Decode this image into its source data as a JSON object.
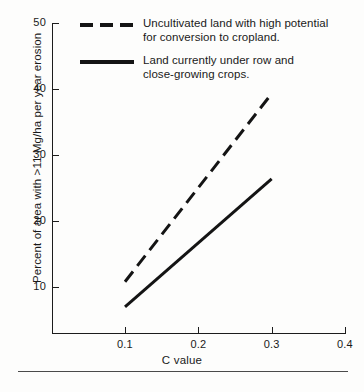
{
  "chart_data": {
    "type": "line",
    "title": "",
    "xlabel": "C value",
    "ylabel": "Percent of area with >11 Mg/ha per year erosion",
    "xlim": [
      0.065,
      0.4
    ],
    "ylim": [
      6.5,
      50
    ],
    "xticks": [
      "0.1",
      "0.2",
      "0.3",
      "0.4"
    ],
    "xtick_values": [
      0.1,
      0.2,
      0.3,
      0.4
    ],
    "yticks": [
      "10",
      "20",
      "30",
      "40",
      "50"
    ],
    "ytick_values": [
      10,
      20,
      30,
      40,
      50
    ],
    "grid": false,
    "legend_position": "top-left",
    "series": [
      {
        "name": "Uncultivated land with high potential for conversion to cropland.",
        "style": "dashed",
        "color": "#141414",
        "x": [
          0.1,
          0.3
        ],
        "values": [
          10.8,
          39.3
        ]
      },
      {
        "name": "Land currently under row and close-growing crops.",
        "style": "solid",
        "color": "#141414",
        "x": [
          0.1,
          0.3
        ],
        "values": [
          7.0,
          26.4
        ]
      }
    ]
  },
  "legend": {
    "entries": [
      {
        "swatch": "dashed",
        "line1": "Uncultivated land with high potential",
        "line2": "for conversion to cropland."
      },
      {
        "swatch": "solid",
        "line1": "Land currently under row and",
        "line2": "close-growing crops."
      }
    ]
  },
  "axis": {
    "x_title": "C value",
    "y_title": "Percent of area with >11 Mg/ha per year erosion"
  }
}
